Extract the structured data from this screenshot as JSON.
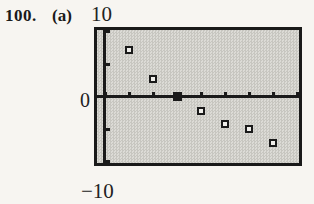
{
  "figure": {
    "problem_number": "100.",
    "part_label": "(a)"
  },
  "chart_data": {
    "type": "scatter",
    "title": "",
    "xlabel": "",
    "ylabel": "",
    "axis_labels": {
      "top": "10",
      "zero": "0",
      "bottom": "−10"
    },
    "ylim": [
      -10,
      10
    ],
    "yscl": 5,
    "xscl": 1,
    "x_ticks_count": 9,
    "grid": "off",
    "legend": "none",
    "marker": "open-square",
    "filled_marker": "solid-square",
    "style": "graphing-calculator viewing window, stippled screen",
    "points": [
      {
        "x": 1,
        "y": 6.8,
        "filled": false
      },
      {
        "x": 2,
        "y": 2.6,
        "filled": false
      },
      {
        "x": 3,
        "y": 0,
        "filled": true
      },
      {
        "x": 4,
        "y": -2.2,
        "filled": false
      },
      {
        "x": 5,
        "y": -4.0,
        "filled": false
      },
      {
        "x": 6,
        "y": -4.8,
        "filled": false
      },
      {
        "x": 7,
        "y": -6.8,
        "filled": false
      }
    ]
  },
  "colors": {
    "ink": "#1a1a1a",
    "page": "#f7f5f1",
    "screen_fill": "#dcdbd6",
    "screen_dot": "#c7c6c0",
    "marker_center": "#efeeea"
  }
}
